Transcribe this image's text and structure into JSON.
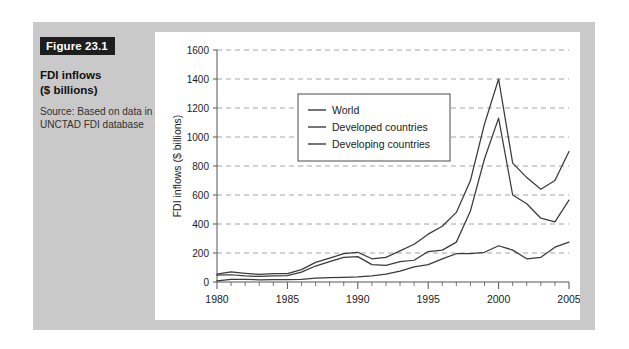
{
  "figure": {
    "badge": "Figure 23.1",
    "title": "FDI inflows\n($ billions)",
    "title_line1": "FDI inflows",
    "title_line2": "($ billions)",
    "source": "Source: Based on data in UNCTAD FDI database",
    "badge_bg": "#1d1d1d",
    "panel_bg": "#c9c9c9",
    "card_bg": "#ffffff"
  },
  "chart_data": {
    "type": "line",
    "title": "",
    "xlabel": "",
    "ylabel": "FDI inflows ($ billions)",
    "xlim": [
      1980,
      2005
    ],
    "ylim": [
      0,
      1600
    ],
    "ytick_values": [
      0,
      200,
      400,
      600,
      800,
      1000,
      1200,
      1400,
      1600
    ],
    "ytick_labels": [
      "0",
      "200",
      "400",
      "600",
      "800",
      "1000",
      "1200",
      "1400",
      "1600"
    ],
    "xtick_values": [
      1980,
      1985,
      1990,
      1995,
      2000,
      2005
    ],
    "xtick_labels": [
      "1980",
      "1985",
      "1990",
      "1995",
      "2000",
      "2005"
    ],
    "minor_xtick_interval": 1,
    "grid": "horizontal-dashed",
    "legend_position": "upper-center-left",
    "x": [
      1980,
      1981,
      1982,
      1983,
      1984,
      1985,
      1986,
      1987,
      1988,
      1989,
      1990,
      1991,
      1992,
      1993,
      1994,
      1995,
      1996,
      1997,
      1998,
      1999,
      2000,
      2001,
      2002,
      2003,
      2004,
      2005
    ],
    "series": [
      {
        "name": "World",
        "color": "#3a3a3a",
        "values": [
          55,
          70,
          60,
          52,
          57,
          58,
          85,
          135,
          165,
          195,
          205,
          160,
          170,
          215,
          260,
          330,
          385,
          480,
          700,
          1090,
          1400,
          820,
          720,
          640,
          700,
          900
        ]
      },
      {
        "name": "Developed countries",
        "color": "#3a3a3a",
        "values": [
          47,
          50,
          42,
          38,
          42,
          44,
          68,
          110,
          140,
          170,
          175,
          120,
          115,
          140,
          150,
          210,
          220,
          275,
          490,
          850,
          1130,
          600,
          540,
          440,
          415,
          565
        ]
      },
      {
        "name": "Developing countries",
        "color": "#3a3a3a",
        "values": [
          8,
          18,
          18,
          15,
          16,
          16,
          18,
          26,
          30,
          32,
          35,
          42,
          55,
          75,
          105,
          120,
          160,
          195,
          195,
          205,
          250,
          220,
          160,
          170,
          240,
          275
        ]
      }
    ]
  }
}
